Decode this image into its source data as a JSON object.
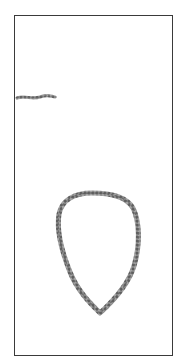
{
  "image": {
    "description": "Scanned photo of a chain: a short chain fragment near the top-left and a teardrop-shaped chain loop in the lower half, inside a thin rectangular frame",
    "objects": [
      {
        "name": "chain-fragment",
        "shape": "short horizontal segment"
      },
      {
        "name": "chain-loop",
        "shape": "teardrop loop pointing downward"
      }
    ],
    "colors": {
      "background": "#ffffff",
      "frame": "#3a3a3a",
      "chain": "#7a7a7a",
      "chain_dark": "#555555"
    }
  }
}
